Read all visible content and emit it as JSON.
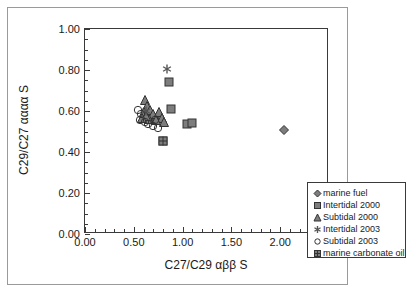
{
  "chart_data": {
    "type": "scatter",
    "title": "",
    "xlabel": "C27/C29 αββ S",
    "ylabel": "C29/C27 αααα S",
    "xlim": [
      0.0,
      2.5
    ],
    "ylim": [
      0.0,
      1.0
    ],
    "xticks": [
      "0.00",
      "0.50",
      "1.00",
      "1.50",
      "2.00",
      "2.50"
    ],
    "xtick_values": [
      0.0,
      0.5,
      1.0,
      1.5,
      2.0,
      2.5
    ],
    "yticks": [
      "0.00",
      "0.20",
      "0.40",
      "0.60",
      "0.80",
      "1.00"
    ],
    "ytick_values": [
      0.0,
      0.2,
      0.4,
      0.6,
      0.8,
      1.0
    ],
    "x_minor_interval": 0.1,
    "y_minor_interval": 0.05,
    "grid": false,
    "legend_position": "lower right",
    "marker_fill": "#7d7d7d",
    "marker_edge": "#333333",
    "axis_color": "#3a3a3a",
    "frame_color": "#9a9a9a",
    "series": [
      {
        "name": "marine fuel",
        "marker": "diamond",
        "fill": "#7d7d7d",
        "points": [
          {
            "x": 2.04,
            "y": 0.505
          }
        ]
      },
      {
        "name": "Intertidal 2000",
        "marker": "square",
        "fill": "#7d7d7d",
        "points": [
          {
            "x": 0.86,
            "y": 0.74
          },
          {
            "x": 0.88,
            "y": 0.61
          },
          {
            "x": 1.05,
            "y": 0.535
          },
          {
            "x": 1.1,
            "y": 0.54
          },
          {
            "x": 0.8,
            "y": 0.455
          },
          {
            "x": 0.72,
            "y": 0.565
          },
          {
            "x": 0.66,
            "y": 0.575
          }
        ]
      },
      {
        "name": "Subtidal 2000",
        "marker": "triangle",
        "fill": "#7d7d7d",
        "points": [
          {
            "x": 0.61,
            "y": 0.655
          },
          {
            "x": 0.64,
            "y": 0.625
          },
          {
            "x": 0.67,
            "y": 0.605
          },
          {
            "x": 0.6,
            "y": 0.595
          },
          {
            "x": 0.7,
            "y": 0.585
          },
          {
            "x": 0.76,
            "y": 0.595
          },
          {
            "x": 0.79,
            "y": 0.565
          },
          {
            "x": 0.73,
            "y": 0.555
          },
          {
            "x": 0.66,
            "y": 0.56
          },
          {
            "x": 0.63,
            "y": 0.575
          },
          {
            "x": 0.58,
            "y": 0.565
          },
          {
            "x": 0.81,
            "y": 0.545
          }
        ]
      },
      {
        "name": "Intertidal 2003",
        "marker": "asterisk",
        "fill": "#555555",
        "points": [
          {
            "x": 0.84,
            "y": 0.805
          },
          {
            "x": 0.8,
            "y": 0.455
          },
          {
            "x": 0.62,
            "y": 0.6
          }
        ]
      },
      {
        "name": "Subtidal 2003",
        "marker": "circle-open",
        "fill": "#ffffff",
        "points": [
          {
            "x": 0.54,
            "y": 0.605
          },
          {
            "x": 0.57,
            "y": 0.585
          },
          {
            "x": 0.56,
            "y": 0.555
          },
          {
            "x": 0.61,
            "y": 0.545
          },
          {
            "x": 0.7,
            "y": 0.525
          },
          {
            "x": 0.75,
            "y": 0.515
          },
          {
            "x": 0.72,
            "y": 0.555
          },
          {
            "x": 0.65,
            "y": 0.535
          }
        ]
      },
      {
        "name": "marine carbonate oil",
        "marker": "square-crossed",
        "fill": "#7d7d7d",
        "points": [
          {
            "x": 0.8,
            "y": 0.455
          }
        ]
      }
    ]
  },
  "legend": {
    "entries": [
      {
        "label": "marine fuel",
        "marker": "diamond"
      },
      {
        "label": "Intertidal 2000",
        "marker": "square"
      },
      {
        "label": "Subtidal 2000",
        "marker": "triangle"
      },
      {
        "label": "Intertidal 2003",
        "marker": "asterisk"
      },
      {
        "label": "Subtidal 2003",
        "marker": "circle-open"
      },
      {
        "label": "marine carbonate oil",
        "marker": "square-crossed"
      }
    ]
  }
}
